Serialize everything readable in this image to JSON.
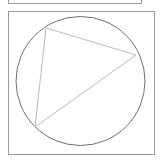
{
  "figure": {
    "type": "inscribed-triangle",
    "colors": {
      "frame": "#9a9a9a",
      "circle": "#6e6e6e",
      "triangle": "#bcbcbc",
      "background": "#ffffff"
    },
    "frame": {
      "x": 8.5,
      "y": 11.5,
      "width": 146,
      "height": 143
    },
    "circle": {
      "cx": 80.5,
      "cy": 81,
      "r": 64.5
    },
    "triangle": {
      "vertices": [
        {
          "x": 46,
          "y": 28
        },
        {
          "x": 136,
          "y": 55
        },
        {
          "x": 35,
          "y": 127
        }
      ]
    }
  }
}
